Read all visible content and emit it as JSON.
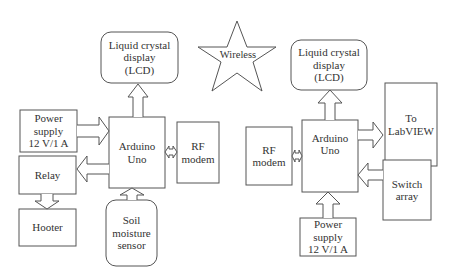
{
  "center": {
    "wireless_label": "Wireless"
  },
  "left": {
    "lcd": "Liquid crystal\ndisplay\n(LCD)",
    "power": "Power\nsupply\n12 V/1 A",
    "arduino": "Arduino\nUno",
    "rf": "RF\nmodem",
    "relay": "Relay",
    "hooter": "Hooter",
    "sensor": "Soil\nmoisture\nsensor"
  },
  "right": {
    "lcd": "Liquid crystal\ndisplay\n(LCD)",
    "labview": "To\nLabVIEW",
    "rf": "RF\nmodem",
    "arduino": "Arduino\nUno",
    "switch": "Switch\narray",
    "power": "Power\nsupply\n12 V/1 A"
  },
  "colors": {
    "stroke": "#555555",
    "text": "#333333",
    "background": "#ffffff"
  }
}
